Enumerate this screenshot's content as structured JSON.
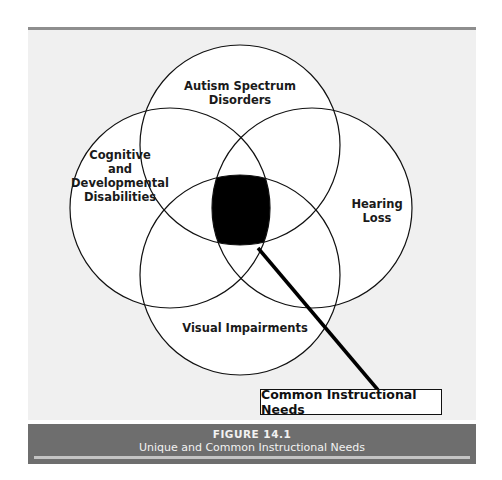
{
  "figure": {
    "number_label": "FIGURE 14.1",
    "title": "Unique and Common Instructional Needs"
  },
  "diagram": {
    "type": "venn",
    "sets": [
      {
        "id": "top",
        "label_lines": [
          "Autism Spectrum",
          "Disorders"
        ]
      },
      {
        "id": "left",
        "label_lines": [
          "Cognitive",
          "and",
          "Developmental",
          "Disabilities"
        ]
      },
      {
        "id": "right",
        "label_lines": [
          "Hearing",
          "Loss"
        ]
      },
      {
        "id": "bottom",
        "label_lines": [
          "Visual Impairments"
        ]
      }
    ],
    "center_region": {
      "label": "Common Instructional Needs",
      "fill": "#000000"
    },
    "colors": {
      "panel": "#f0f0f0",
      "circle_fill": "#ffffff",
      "stroke": "#111111",
      "caption_bar": "#6e6e6e"
    }
  }
}
